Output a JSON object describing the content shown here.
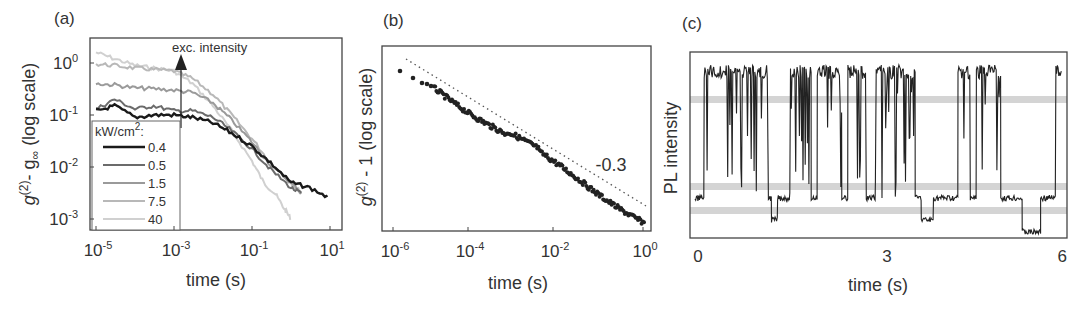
{
  "chart_data": [
    {
      "panel": "(a)",
      "type": "line",
      "title": "",
      "xlabel": "time (s)",
      "ylabel": "g(2) - g∞ (log scale)",
      "xscale": "log",
      "yscale": "log",
      "xlim": [
        1e-05,
        10
      ],
      "ylim": [
        0.0007,
        3
      ],
      "xticks": [
        "10^-5",
        "10^-3",
        "10^-1",
        "10^1"
      ],
      "yticks": [
        "10^0",
        "10^-1",
        "10^-2",
        "10^-3"
      ],
      "annotation": "exc. intensity",
      "legend_title": "kW/cm²:",
      "legend_position": "lower left",
      "series": [
        {
          "name": "0.4",
          "color": "#1a1a1a",
          "x": [
            1e-05,
            3e-05,
            0.0001,
            0.0003,
            0.001,
            0.003,
            0.01,
            0.03,
            0.1,
            0.3,
            1,
            3,
            10
          ],
          "y": [
            0.12,
            0.15,
            0.09,
            0.1,
            0.1,
            0.09,
            0.07,
            0.045,
            0.025,
            0.012,
            0.005,
            0.004,
            0.0025
          ]
        },
        {
          "name": "0.5",
          "color": "#6b6b6b",
          "x": [
            1e-05,
            3e-05,
            0.0001,
            0.0003,
            0.001,
            0.003,
            0.01,
            0.03,
            0.1,
            0.3,
            1,
            2
          ],
          "y": [
            0.13,
            0.2,
            0.13,
            0.15,
            0.12,
            0.12,
            0.09,
            0.05,
            0.022,
            0.009,
            0.004,
            0.003
          ]
        },
        {
          "name": "1.5",
          "color": "#9a9a9a",
          "x": [
            1e-05,
            3e-05,
            0.0001,
            0.0003,
            0.001,
            0.003,
            0.01,
            0.03,
            0.1,
            0.3,
            1,
            2
          ],
          "y": [
            0.4,
            0.38,
            0.33,
            0.32,
            0.3,
            0.27,
            0.17,
            0.08,
            0.03,
            0.011,
            0.005,
            0.003
          ]
        },
        {
          "name": "7.5",
          "color": "#b8b8b8",
          "x": [
            1e-05,
            3e-05,
            0.0001,
            0.0003,
            0.001,
            0.003,
            0.01,
            0.03,
            0.1,
            0.3,
            1,
            2
          ],
          "y": [
            0.95,
            0.9,
            0.8,
            0.75,
            0.7,
            0.5,
            0.25,
            0.1,
            0.035,
            0.012,
            0.005,
            0.003
          ]
        },
        {
          "name": "40",
          "color": "#d0d0d0",
          "x": [
            1e-05,
            3e-05,
            0.0001,
            0.0003,
            0.001,
            0.003,
            0.01,
            0.03,
            0.1,
            0.2,
            0.4,
            0.7,
            1
          ],
          "y": [
            1.6,
            1.2,
            0.9,
            0.8,
            0.7,
            0.4,
            0.15,
            0.05,
            0.013,
            0.005,
            0.003,
            0.0015,
            0.001
          ]
        }
      ]
    },
    {
      "panel": "(b)",
      "type": "scatter",
      "xlabel": "time (s)",
      "ylabel": "g(2) - 1 (log scale)",
      "xscale": "log",
      "yscale": "log",
      "xlim": [
        3e-07,
        1.5
      ],
      "xticks": [
        "10^-6",
        "10^-4",
        "10^-2",
        "10^0"
      ],
      "annotation": "-0.3",
      "fit_slope": -0.3,
      "series": [
        {
          "name": "data",
          "color": "#222222",
          "x": [
            1e-06,
            2e-06,
            3e-06,
            5e-06,
            1e-05,
            3e-05,
            0.0001,
            0.0003,
            0.001,
            0.003,
            0.01,
            0.03,
            0.1,
            0.3,
            1
          ],
          "y_px_rel": [
            0.13,
            0.2,
            0.25,
            0.28,
            0.33,
            0.4,
            0.45,
            0.5,
            0.57,
            0.63,
            0.68,
            0.74,
            0.8,
            0.87,
            0.95
          ]
        },
        {
          "name": "power-law guide (slope -0.3)",
          "style": "dotted",
          "color": "#555555"
        }
      ]
    },
    {
      "panel": "(c)",
      "type": "line",
      "xlabel": "time (s)",
      "ylabel": "PL intensity",
      "xlim": [
        0,
        6
      ],
      "xticks": [
        "0",
        "3",
        "6"
      ],
      "threshold_bands": [
        "high",
        "mid",
        "low"
      ],
      "series": [
        {
          "name": "PL intensity trace",
          "color": "#222222",
          "description": "blinking trace switching between high (~top), intermediate and low levels"
        }
      ]
    }
  ],
  "labels": {
    "a": "(a)",
    "b": "(b)",
    "c": "(c)",
    "a_xlabel": "time (s)",
    "a_ylabel_main": "g",
    "a_ylabel_sup": "(2)",
    "a_ylabel_mid": "- g",
    "a_ylabel_sub": "∞",
    "a_ylabel_tail": " (log scale)",
    "a_annotation": "exc. intensity",
    "legend_title": "kW/cm",
    "legend_title_sup": "2",
    "legend_title_tail": ":",
    "b_xlabel": "time (s)",
    "b_ylabel_main": "g",
    "b_ylabel_sup": "(2)",
    "b_ylabel_tail": " - 1 (log scale)",
    "b_annotation": "-0.3",
    "c_xlabel": "time (s)",
    "c_ylabel": "PL intensity"
  }
}
